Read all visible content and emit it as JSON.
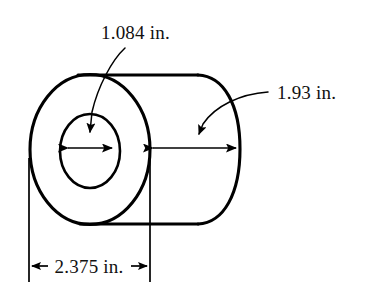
{
  "figure": {
    "background_color": "#ffffff",
    "line_color": "#000000",
    "text_color": "#111111"
  },
  "labels": {
    "bore_diameter": "1.084 in.",
    "length": "1.93 in.",
    "outer_diameter": "2.375 in."
  },
  "dimensions": [
    {
      "name": "bore-diameter",
      "value": "1.084 in.",
      "numeric": 1.084,
      "unit": "in.",
      "feature": "inner bore diameter",
      "leader": "curved leader from label down to bore arrow",
      "arrow_style": "double-headed horizontal"
    },
    {
      "name": "cylinder-length",
      "value": "1.93 in.",
      "numeric": 1.93,
      "unit": "in.",
      "feature": "axial length of cylinder",
      "leader": "curved leader from label down-left to length arrow",
      "arrow_style": "double-headed horizontal"
    },
    {
      "name": "outer-diameter",
      "value": "2.375 in.",
      "numeric": 2.375,
      "unit": "in.",
      "feature": "outer diameter of cylinder face",
      "leader": "extension lines down from left and right extremes",
      "arrow_style": "outward-pointing pair"
    }
  ],
  "geometry": {
    "outer_ellipse": {
      "cx": 90,
      "cy": 149,
      "rx": 60,
      "ry": 75
    },
    "bore_ellipse": {
      "cx": 90,
      "cy": 151,
      "rx": 30,
      "ry": 37
    },
    "body_top_y": 76,
    "body_bottom_y": 223,
    "body_right_x": 240,
    "extension_left_x": 29,
    "extension_right_x": 150,
    "bottom_dim_y": 266
  }
}
